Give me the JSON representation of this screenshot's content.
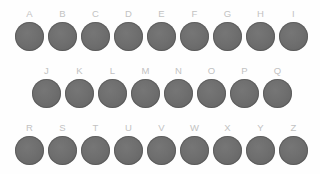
{
  "board": {
    "background_color": "#fefefe",
    "disc_color": "#6e6e6e",
    "disc_rim_color": "#595959",
    "label_color": "#c2c2c2",
    "disc_diameter_px": 29,
    "column_spacing_px": 33
  },
  "rows": [
    {
      "row_id": "row-1",
      "offset_left_px": 13,
      "offset_top_px": 9,
      "items": [
        {
          "label": "A"
        },
        {
          "label": "B"
        },
        {
          "label": "C"
        },
        {
          "label": "D"
        },
        {
          "label": "E"
        },
        {
          "label": "F"
        },
        {
          "label": "G"
        },
        {
          "label": "H"
        },
        {
          "label": "I"
        }
      ]
    },
    {
      "row_id": "row-2",
      "offset_left_px": 30,
      "offset_top_px": 66,
      "items": [
        {
          "label": "J"
        },
        {
          "label": "K"
        },
        {
          "label": "L"
        },
        {
          "label": "M"
        },
        {
          "label": "N"
        },
        {
          "label": "O"
        },
        {
          "label": "P"
        },
        {
          "label": "Q"
        }
      ]
    },
    {
      "row_id": "row-3",
      "offset_left_px": 13,
      "offset_top_px": 123,
      "items": [
        {
          "label": "R"
        },
        {
          "label": "S"
        },
        {
          "label": "T"
        },
        {
          "label": "U"
        },
        {
          "label": "V"
        },
        {
          "label": "W"
        },
        {
          "label": "X"
        },
        {
          "label": "Y"
        },
        {
          "label": "Z"
        }
      ]
    }
  ]
}
